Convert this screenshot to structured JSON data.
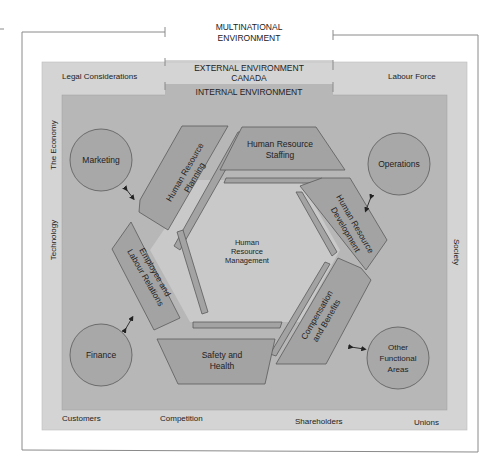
{
  "colors": {
    "background": "#ffffff",
    "frame_line": "#8a8a8a",
    "external": "#d4d4d4",
    "internal": "#b5b5b5",
    "segment": "#a3a3a3",
    "segment_stroke": "#5a5a5a",
    "circle": "#a8a8a8",
    "center_hex": "#c9c9c9",
    "text": "#222222"
  },
  "frames": {
    "multinational": {
      "line1": "MULTINATIONAL",
      "line2": "ENVIRONMENT"
    },
    "external": {
      "line1": "EXTERNAL ENVIRONMENT",
      "line2": "CANADA"
    },
    "internal": {
      "label": "INTERNAL ENVIRONMENT"
    }
  },
  "external_factors": {
    "top_left": "Legal Considerations",
    "top_right": "Labour Force",
    "left_top": "The Economy",
    "left_middle": "Technology",
    "right_middle": "Society",
    "bottom": [
      "Customers",
      "Competition",
      "Shareholders",
      "Unions"
    ]
  },
  "center": {
    "line1": "Human",
    "line2": "Resource",
    "line3": "Management"
  },
  "hr_functions": [
    {
      "id": "planning",
      "line1": "Human Resource",
      "line2": "Planning"
    },
    {
      "id": "staffing",
      "line1": "Human Resource",
      "line2": "Staffing"
    },
    {
      "id": "development",
      "line1": "Human Resource",
      "line2": "Development"
    },
    {
      "id": "compensation",
      "line1": "Compensation",
      "line2": "and Benefits"
    },
    {
      "id": "safety",
      "line1": "Safety and",
      "line2": "Health"
    },
    {
      "id": "employee_relations",
      "line1": "Employee and",
      "line2": "Labour Relations"
    }
  ],
  "functional_areas": [
    {
      "id": "marketing",
      "line1": "Marketing",
      "line2": "",
      "line3": ""
    },
    {
      "id": "operations",
      "line1": "Operations",
      "line2": "",
      "line3": ""
    },
    {
      "id": "finance",
      "line1": "Finance",
      "line2": "",
      "line3": ""
    },
    {
      "id": "other",
      "line1": "Other",
      "line2": "Functional",
      "line3": "Areas"
    }
  ]
}
